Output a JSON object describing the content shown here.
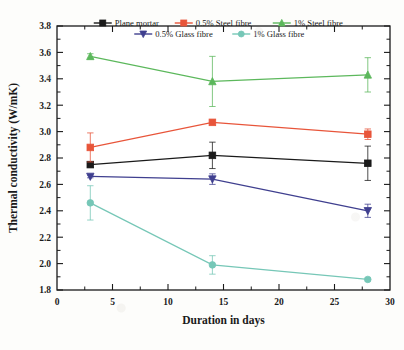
{
  "chart_data": {
    "type": "line",
    "title": "",
    "xlabel": "Duration in days",
    "ylabel": "Thermal conductivity (W/mK)",
    "xlim": [
      0,
      30
    ],
    "ylim": [
      1.8,
      3.8
    ],
    "xticks": [
      0,
      5,
      10,
      15,
      20,
      25,
      30
    ],
    "xtick_labels": [
      "0",
      "5",
      "10",
      "15",
      "20",
      "25",
      "30"
    ],
    "yticks": [
      1.8,
      2.0,
      2.2,
      2.4,
      2.6,
      2.8,
      3.0,
      3.2,
      3.4,
      3.6,
      3.8
    ],
    "ytick_labels": [
      "1.8",
      "2.0",
      "2.2",
      "2.4",
      "2.6",
      "2.8",
      "3.0",
      "3.2",
      "3.4",
      "3.6",
      "3.8"
    ],
    "grid": false,
    "legend_position": "top-inside",
    "x": [
      3,
      14,
      28
    ],
    "series": [
      {
        "name": "Plane mortar",
        "color": "#1a1a1a",
        "marker": "square",
        "values": [
          2.75,
          2.82,
          2.76
        ],
        "errors": [
          0.02,
          0.1,
          0.13
        ]
      },
      {
        "name": "0.5% Steel fibre",
        "color": "#e8553a",
        "marker": "square",
        "values": [
          2.88,
          3.07,
          2.98
        ],
        "errors": [
          0.11,
          0.0,
          0.04
        ]
      },
      {
        "name": "1% Steel fibre",
        "color": "#5cb85c",
        "marker": "triangle-up",
        "values": [
          3.57,
          3.38,
          3.43
        ],
        "errors": [
          0.02,
          0.19,
          0.13
        ]
      },
      {
        "name": "0.5% Glass fibre",
        "color": "#3f3f8f",
        "marker": "triangle-down",
        "values": [
          2.66,
          2.64,
          2.4
        ],
        "errors": [
          0.01,
          0.04,
          0.05
        ]
      },
      {
        "name": "1% Glass fibre",
        "color": "#76c7b7",
        "marker": "circle",
        "values": [
          2.46,
          1.99,
          1.88
        ],
        "errors": [
          0.13,
          0.07,
          0.01
        ]
      }
    ]
  },
  "axes": {
    "xlabel": "Duration in days",
    "ylabel": "Thermal conductivity (W/mK)"
  },
  "legend": {
    "row1": [
      "Plane mortar",
      "0.5% Steel fibre",
      "1% Steel fibre"
    ],
    "row2": [
      "0.5% Glass fibre",
      "1% Glass fibre"
    ]
  }
}
